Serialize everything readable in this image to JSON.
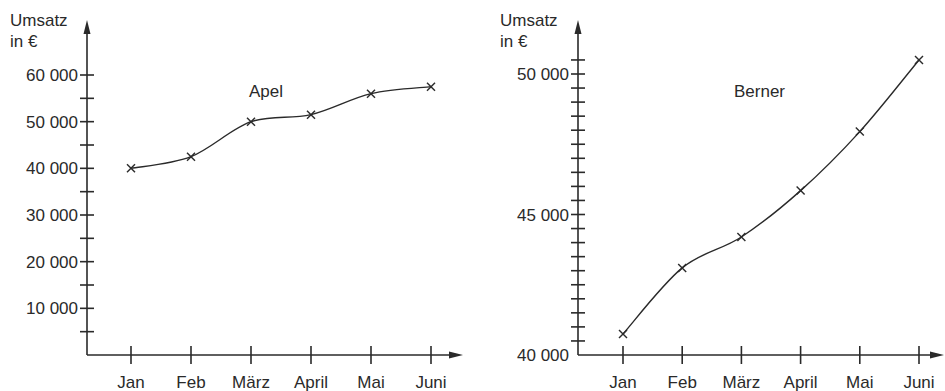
{
  "chart_data": [
    {
      "type": "line",
      "title": "Apel",
      "ylabel": "Umsatz in €",
      "xlabel": "",
      "categories": [
        "Jan",
        "Feb",
        "März",
        "April",
        "Mai",
        "Juni"
      ],
      "values": [
        40000,
        42500,
        50000,
        51500,
        56000,
        57500
      ],
      "ylim": [
        0,
        65000
      ],
      "yticks_labeled": [
        "10 000",
        "20 000",
        "30 000",
        "40 000",
        "50 000",
        "60 000"
      ],
      "ytick_values": [
        10000,
        20000,
        30000,
        40000,
        50000,
        60000
      ],
      "minor_tick_step": 5000,
      "grid": false,
      "legend": null,
      "markers": "x"
    },
    {
      "type": "line",
      "title": "Berner",
      "ylabel": "Umsatz in €",
      "xlabel": "",
      "categories": [
        "Jan",
        "Feb",
        "März",
        "April",
        "Mai",
        "Juni"
      ],
      "values": [
        40750,
        43100,
        44200,
        45850,
        47950,
        50500
      ],
      "ylim": [
        40000,
        51000
      ],
      "yticks_labeled": [
        "40 000",
        "45 000",
        "50 000"
      ],
      "ytick_values": [
        40000,
        45000,
        50000
      ],
      "minor_tick_step": 500,
      "grid": false,
      "legend": null,
      "markers": "x"
    }
  ],
  "left": {
    "ylabel_line1": "Umsatz",
    "ylabel_line2": "in €",
    "title": "Apel"
  },
  "right": {
    "ylabel_line1": "Umsatz",
    "ylabel_line2": "in €",
    "title": "Berner"
  }
}
